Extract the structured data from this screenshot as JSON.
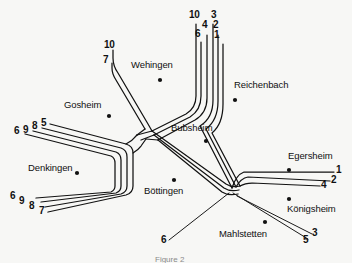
{
  "figure": {
    "caption": "Figure 2",
    "background_color": "#f7f7f5",
    "ink_color": "#121212"
  },
  "cities": [
    {
      "name": "Wehingen",
      "label_x": 131,
      "label_y": 65,
      "dot_x": 160,
      "dot_y": 80
    },
    {
      "name": "Reichenbach",
      "label_x": 234,
      "label_y": 85,
      "dot_x": 235,
      "dot_y": 100
    },
    {
      "name": "Gosheim",
      "label_x": 64,
      "label_y": 105,
      "dot_x": 109,
      "dot_y": 116
    },
    {
      "name": "Bubsheim",
      "label_x": 171,
      "label_y": 128,
      "dot_x": 206,
      "dot_y": 141
    },
    {
      "name": "Egersheim",
      "label_x": 288,
      "label_y": 156,
      "dot_x": 289,
      "dot_y": 170
    },
    {
      "name": "Denkingen",
      "label_x": 28,
      "label_y": 168,
      "dot_x": 77,
      "dot_y": 173
    },
    {
      "name": "Böttingen",
      "label_x": 144,
      "label_y": 188,
      "dot_x": 174,
      "dot_y": 180
    },
    {
      "name": "Königsheim",
      "label_x": 287,
      "label_y": 208,
      "dot_x": 289,
      "dot_y": 199
    },
    {
      "name": "Mahlstetten",
      "label_x": 219,
      "label_y": 233,
      "dot_x": 265,
      "dot_y": 222
    }
  ],
  "line_labels": [
    {
      "id": "top-left-10",
      "text": "10",
      "x": 104,
      "y": 45
    },
    {
      "id": "top-left-7",
      "text": "7",
      "x": 103,
      "y": 60
    },
    {
      "id": "top-right-10",
      "text": "10",
      "x": 190,
      "y": 14
    },
    {
      "id": "top-right-6",
      "text": "6",
      "x": 195,
      "y": 33
    },
    {
      "id": "top-right-4",
      "text": "4",
      "x": 202,
      "y": 25
    },
    {
      "id": "top-right-3",
      "text": "3",
      "x": 211,
      "y": 14
    },
    {
      "id": "top-right-2",
      "text": "2",
      "x": 213,
      "y": 25
    },
    {
      "id": "top-right-1",
      "text": "1",
      "x": 214,
      "y": 35
    },
    {
      "id": "left-upper-6",
      "text": "6",
      "x": 15,
      "y": 131
    },
    {
      "id": "left-upper-9",
      "text": "9",
      "x": 24,
      "y": 130
    },
    {
      "id": "left-upper-8",
      "text": "8",
      "x": 33,
      "y": 126
    },
    {
      "id": "left-upper-5",
      "text": "5",
      "x": 42,
      "y": 124
    },
    {
      "id": "left-lower-6",
      "text": "6",
      "x": 11,
      "y": 196
    },
    {
      "id": "left-lower-9",
      "text": "9",
      "x": 20,
      "y": 201
    },
    {
      "id": "left-lower-8",
      "text": "8",
      "x": 30,
      "y": 206
    },
    {
      "id": "left-lower-7",
      "text": "7",
      "x": 40,
      "y": 211
    },
    {
      "id": "right-1",
      "text": "1",
      "x": 337,
      "y": 170
    },
    {
      "id": "right-2",
      "text": "2",
      "x": 332,
      "y": 180
    },
    {
      "id": "right-4",
      "text": "4",
      "x": 322,
      "y": 184
    },
    {
      "id": "bottom-right-5",
      "text": "5",
      "x": 304,
      "y": 240
    },
    {
      "id": "bottom-right-3",
      "text": "3",
      "x": 313,
      "y": 233
    },
    {
      "id": "bottom-left-6",
      "text": "6",
      "x": 162,
      "y": 240
    }
  ],
  "network": {
    "description": "Schematic bus/rail network diagram of villages on the Heuberg plateau",
    "hub_center": {
      "x": 137,
      "y": 136
    },
    "junction_east": {
      "x": 232,
      "y": 191
    },
    "branches": [
      {
        "id": "northwest-spur",
        "lines": [
          "10",
          "7"
        ],
        "from": "hub",
        "to": "northwest-terminus"
      },
      {
        "id": "north-trunk",
        "lines": [
          "10",
          "6",
          "4",
          "3",
          "2",
          "1"
        ],
        "from": "wehingen-junction",
        "to": "north-terminus"
      },
      {
        "id": "west-upper",
        "lines": [
          "6",
          "9",
          "8",
          "5"
        ],
        "from": "hub",
        "to": "west-upper-terminus"
      },
      {
        "id": "west-lower",
        "lines": [
          "6",
          "9",
          "8",
          "7"
        ],
        "from": "hub",
        "to": "west-lower-terminus"
      },
      {
        "id": "east-trunk",
        "lines": [
          "1",
          "2",
          "4"
        ],
        "from": "junction-east",
        "to": "east-terminus"
      },
      {
        "id": "southeast-spur",
        "lines": [
          "5",
          "3"
        ],
        "from": "junction-east",
        "to": "southeast-terminus"
      },
      {
        "id": "southwest-spur",
        "lines": [
          "6"
        ],
        "from": "junction-east",
        "to": "southwest-terminus"
      }
    ]
  }
}
